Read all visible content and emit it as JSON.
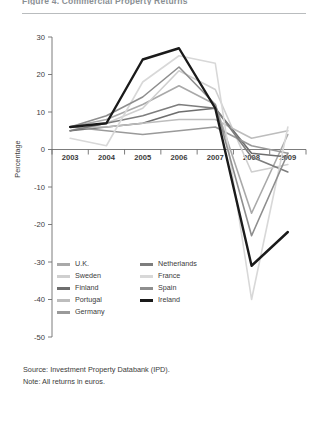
{
  "header": {
    "title_fragment": "Figure 4. Commercial Property Returns",
    "rule": true
  },
  "notes": {
    "source": "Source: Investment Property Databank (IPD).",
    "note": "Note: All returns in euros."
  },
  "legend": {
    "left": [
      {
        "label": "U.K.",
        "color": "#a9a9a9"
      },
      {
        "label": "Sweden",
        "color": "#cfcfcf"
      },
      {
        "label": "Finland",
        "color": "#6e6e6e"
      },
      {
        "label": "Portugal",
        "color": "#bdbdbd"
      },
      {
        "label": "Germany",
        "color": "#9a9a9a"
      }
    ],
    "right": [
      {
        "label": "Netherlands",
        "color": "#7d7d7d"
      },
      {
        "label": "France",
        "color": "#d8d8d8"
      },
      {
        "label": "Spain",
        "color": "#8e8e8e"
      },
      {
        "label": "Ireland",
        "color": "#1a1a1a"
      }
    ]
  },
  "chart_data": {
    "type": "line",
    "title": "",
    "xlabel": "",
    "ylabel": "Percentage",
    "x": [
      "2003",
      "2004",
      "2005",
      "2006",
      "2007",
      "2008",
      "2009"
    ],
    "ylim": [
      -50,
      30
    ],
    "yticks": [
      30,
      20,
      10,
      0,
      -10,
      -20,
      -30,
      -40,
      -50
    ],
    "grid": false,
    "legend_position": "bottom-left",
    "series": [
      {
        "name": "U.K.",
        "color": "#a9a9a9",
        "width": 1.6,
        "values": [
          6,
          8,
          12,
          17,
          12,
          -17,
          4
        ]
      },
      {
        "name": "Sweden",
        "color": "#cfcfcf",
        "width": 1.6,
        "values": [
          5,
          7,
          11,
          21,
          16,
          -6,
          -4
        ]
      },
      {
        "name": "Finland",
        "color": "#6e6e6e",
        "width": 1.6,
        "values": [
          5,
          6,
          7,
          10,
          11,
          -1,
          -2
        ]
      },
      {
        "name": "Portugal",
        "color": "#bdbdbd",
        "width": 1.6,
        "values": [
          6,
          6,
          7,
          8,
          8,
          3,
          5
        ]
      },
      {
        "name": "Germany",
        "color": "#9a9a9a",
        "width": 1.6,
        "values": [
          6,
          5,
          4,
          5,
          6,
          1,
          -1
        ]
      },
      {
        "name": "Netherlands",
        "color": "#7d7d7d",
        "width": 1.6,
        "values": [
          5,
          7,
          9,
          12,
          11,
          -2,
          -6
        ]
      },
      {
        "name": "France",
        "color": "#d8d8d8",
        "width": 1.6,
        "values": [
          3,
          1,
          18,
          25,
          23,
          -40,
          6
        ]
      },
      {
        "name": "Spain",
        "color": "#8e8e8e",
        "width": 1.6,
        "values": [
          6,
          9,
          14,
          22,
          12,
          -23,
          -1
        ]
      },
      {
        "name": "Ireland",
        "color": "#1a1a1a",
        "width": 2.4,
        "values": [
          6,
          7,
          24,
          27,
          11,
          -31,
          -22
        ]
      }
    ]
  },
  "axis": {
    "y_label": "Percentage"
  }
}
